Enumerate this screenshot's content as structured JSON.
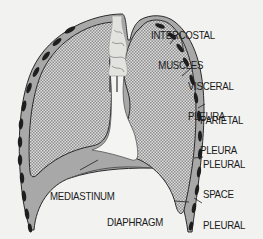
{
  "diagram": {
    "labels": {
      "intercostal_muscles": [
        "INTERCOSTAL",
        "MUSCLES"
      ],
      "visceral_pleura": [
        "VISCERAL",
        "PLEURA"
      ],
      "parietal_pleura": [
        "PARIETAL",
        "PLEURA"
      ],
      "pleural_space": [
        "PLEURAL",
        "SPACE"
      ],
      "mediastinum": [
        "MEDIASTINUM"
      ],
      "diaphragm": [
        "DIAPHRAGM"
      ],
      "pleural_recess": [
        "PLEURAL",
        "RECESS"
      ]
    },
    "colors": {
      "background": "#f2f2f0",
      "lung_fill_light": "#e6e6e6",
      "lung_fill_dark": "#9a9a9a",
      "pleura_band": "#8a8a8a",
      "outline": "#2a2a2a",
      "muscle": "#1e1e1e",
      "mediastinum": "#f4f4f2"
    }
  }
}
